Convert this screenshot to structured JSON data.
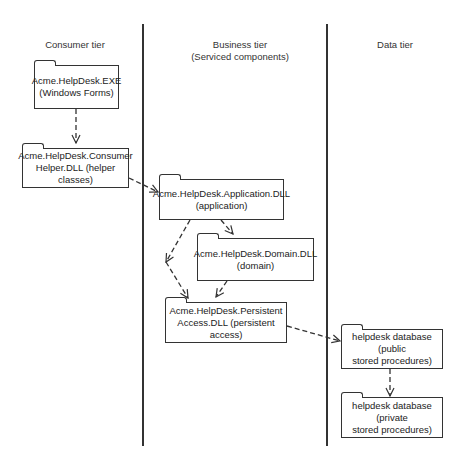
{
  "tiers": [
    {
      "label": "Consumer tier"
    },
    {
      "label": "Business tier\n(Serviced components)"
    },
    {
      "label": "Data tier"
    }
  ],
  "packages": {
    "exe": {
      "label": "Acme.HelpDesk.EXE\n(Windows Forms)"
    },
    "consumer_helper": {
      "label": "Acme.HelpDesk.Consumer\nHelper.DLL (helper classes)"
    },
    "application": {
      "label": "Acme.HelpDesk.Application.DLL\n(application)"
    },
    "domain": {
      "label": "Acme.HelpDesk.Domain.DLL\n(domain)"
    },
    "persistent": {
      "label": "Acme.HelpDesk.Persistent\nAccess.DLL (persistent access)"
    },
    "db_public": {
      "label": "helpdesk database (public\nstored procedures)"
    },
    "db_private": {
      "label": "helpdesk database (private\nstored procedures)"
    }
  },
  "dependencies": [
    {
      "from": "exe",
      "to": "consumer_helper"
    },
    {
      "from": "consumer_helper",
      "to": "application"
    },
    {
      "from": "application",
      "to": "domain"
    },
    {
      "from": "application",
      "to": "persistent"
    },
    {
      "from": "domain",
      "to": "persistent"
    },
    {
      "from": "persistent",
      "to": "db_public"
    },
    {
      "from": "db_public",
      "to": "db_private"
    }
  ],
  "colors": {
    "line": "#333333",
    "background": "#ffffff"
  }
}
